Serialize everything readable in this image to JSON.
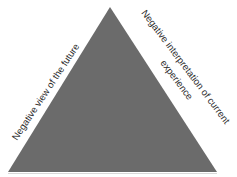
{
  "diagram": {
    "type": "cognitive-triad-triangle",
    "shape": {
      "fill": "#6b6b6b",
      "apex": [
        110,
        7
      ],
      "base_left": [
        8,
        172
      ],
      "base_right": [
        217,
        172
      ]
    },
    "labels": {
      "left_side": "Negative view of the future",
      "right_side_line1": "Negative interpretation of current",
      "right_side_line2": "experience"
    }
  }
}
